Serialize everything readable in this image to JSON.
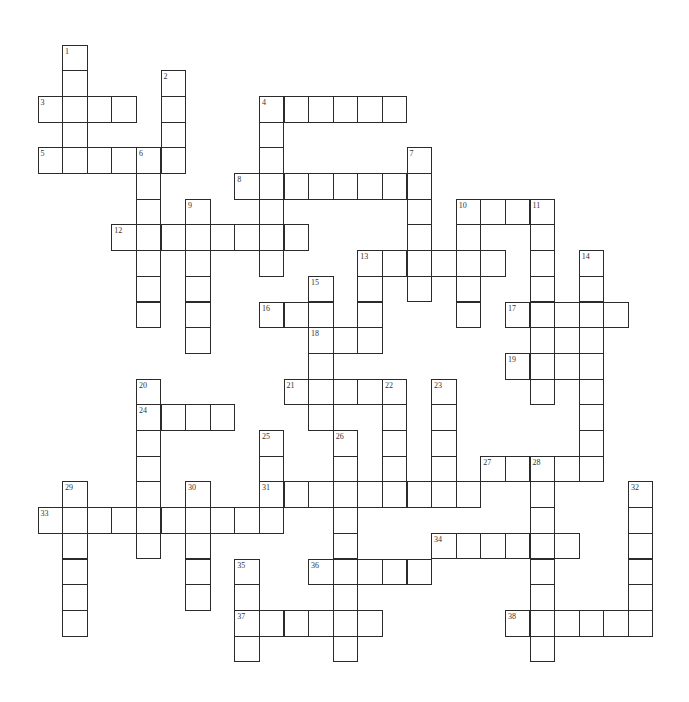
{
  "puzzle": {
    "type": "crossword",
    "grid": {
      "origin_x": 38,
      "origin_y": 45,
      "cell_w": 24.6,
      "cell_h": 25.7,
      "cols": 25,
      "rows": 24
    },
    "colors": {
      "line": "#2b2b2b",
      "cell": "#ffffff",
      "shaded": "#d6d6d6"
    },
    "shaded_cells": [
      {
        "col": 21,
        "row": 11
      }
    ],
    "across": [
      {
        "number": "3",
        "col": 0,
        "row": 2,
        "length": 4
      },
      {
        "number": "4",
        "col": 9,
        "row": 2,
        "length": 6
      },
      {
        "number": "5",
        "col": 0,
        "row": 4,
        "length": 6
      },
      {
        "number": "8",
        "col": 8,
        "row": 5,
        "length": 8
      },
      {
        "number": "10",
        "col": 17,
        "row": 6,
        "length": 4
      },
      {
        "number": "12",
        "col": 3,
        "row": 7,
        "length": 8
      },
      {
        "number": "13",
        "col": 13,
        "row": 8,
        "length": 6
      },
      {
        "number": "16",
        "col": 9,
        "row": 10,
        "length": 3
      },
      {
        "number": "17",
        "col": 19,
        "row": 10,
        "length": 5
      },
      {
        "number": "18",
        "col": 11,
        "row": 11,
        "length": 3
      },
      {
        "number": "19",
        "col": 19,
        "row": 12,
        "length": 4
      },
      {
        "number": "21",
        "col": 10,
        "row": 13,
        "length": 5
      },
      {
        "number": "24",
        "col": 4,
        "row": 14,
        "length": 4
      },
      {
        "number": "27",
        "col": 18,
        "row": 16,
        "length": 5
      },
      {
        "number": "31",
        "col": 9,
        "row": 17,
        "length": 9
      },
      {
        "number": "33",
        "col": 0,
        "row": 18,
        "length": 10
      },
      {
        "number": "34",
        "col": 16,
        "row": 19,
        "length": 6
      },
      {
        "number": "36",
        "col": 11,
        "row": 20,
        "length": 5
      },
      {
        "number": "37",
        "col": 8,
        "row": 22,
        "length": 6
      },
      {
        "number": "38",
        "col": 19,
        "row": 22,
        "length": 6
      }
    ],
    "down": [
      {
        "number": "1",
        "col": 1,
        "row": 0,
        "length": 5
      },
      {
        "number": "2",
        "col": 5,
        "row": 1,
        "length": 4
      },
      {
        "number": "4",
        "col": 9,
        "row": 2,
        "length": 7
      },
      {
        "number": "6",
        "col": 4,
        "row": 4,
        "length": 7
      },
      {
        "number": "7",
        "col": 15,
        "row": 4,
        "length": 6
      },
      {
        "number": "9",
        "col": 6,
        "row": 6,
        "length": 6
      },
      {
        "number": "10",
        "col": 17,
        "row": 6,
        "length": 5
      },
      {
        "number": "11",
        "col": 20,
        "row": 6,
        "length": 8
      },
      {
        "number": "13",
        "col": 13,
        "row": 8,
        "length": 4
      },
      {
        "number": "14",
        "col": 22,
        "row": 8,
        "length": 9
      },
      {
        "number": "15",
        "col": 11,
        "row": 9,
        "length": 6
      },
      {
        "number": "20",
        "col": 4,
        "row": 13,
        "length": 7
      },
      {
        "number": "22",
        "col": 14,
        "row": 13,
        "length": 5
      },
      {
        "number": "23",
        "col": 16,
        "row": 13,
        "length": 5
      },
      {
        "number": "25",
        "col": 9,
        "row": 15,
        "length": 4
      },
      {
        "number": "26",
        "col": 12,
        "row": 15,
        "length": 9
      },
      {
        "number": "28",
        "col": 20,
        "row": 16,
        "length": 8
      },
      {
        "number": "29",
        "col": 1,
        "row": 17,
        "length": 6
      },
      {
        "number": "30",
        "col": 6,
        "row": 17,
        "length": 5
      },
      {
        "number": "32",
        "col": 24,
        "row": 17,
        "length": 6
      },
      {
        "number": "35",
        "col": 8,
        "row": 20,
        "length": 4
      }
    ]
  }
}
